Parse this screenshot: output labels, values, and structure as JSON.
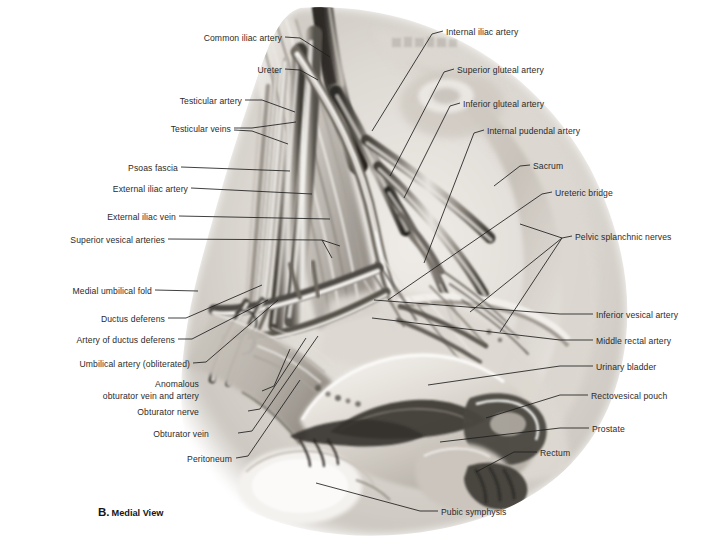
{
  "figure": {
    "caption_letter": "B.",
    "caption_text": "Medial View",
    "style": "grayscale airbrush / pencil medical illustration on white background",
    "palette": {
      "background": "#ffffff",
      "label_text": "#2b2b2b",
      "leader_line": "#1f1f1f",
      "tissue_light": "#e9e6e2",
      "tissue_mid": "#b9b4ae",
      "tissue_dark": "#6d6963",
      "tissue_deep": "#3a3834",
      "highlight": "#fbfaf8"
    }
  },
  "labels_left": [
    {
      "id": "common-iliac-artery",
      "text": "Common iliac artery",
      "x": 282,
      "y": 40
    },
    {
      "id": "ureter",
      "text": "Ureter",
      "x": 282,
      "y": 72
    },
    {
      "id": "testicular-artery",
      "text": "Testicular artery",
      "x": 242,
      "y": 103
    },
    {
      "id": "testicular-veins",
      "text": "Testicular veins",
      "x": 231,
      "y": 131
    },
    {
      "id": "psoas-fascia",
      "text": "Psoas fascia",
      "x": 178,
      "y": 170
    },
    {
      "id": "external-iliac-artery",
      "text": "External iliac artery",
      "x": 188,
      "y": 191
    },
    {
      "id": "external-iliac-vein",
      "text": "External iliac vein",
      "x": 176,
      "y": 219
    },
    {
      "id": "superior-vesical-arteries",
      "text": "Superior vesical arteries",
      "x": 165,
      "y": 242
    },
    {
      "id": "medial-umbilical-fold",
      "text": "Medial umbilical fold",
      "x": 152,
      "y": 293
    },
    {
      "id": "ductus-deferens",
      "text": "Ductus deferens",
      "x": 165,
      "y": 321
    },
    {
      "id": "artery-of-ductus-deferens",
      "text": "Artery of ductus deferens",
      "x": 175,
      "y": 342
    },
    {
      "id": "umbilical-artery-obliterated",
      "text": "Umbilical artery (obliterated)",
      "x": 190,
      "y": 366
    },
    {
      "id": "anomalous-obturator-1",
      "text": "Anomalous",
      "x": 199,
      "y": 386
    },
    {
      "id": "anomalous-obturator-2",
      "text": "obturator vein and artery",
      "x": 199,
      "y": 398
    },
    {
      "id": "obturator-nerve",
      "text": "Obturator nerve",
      "x": 199,
      "y": 414
    },
    {
      "id": "obturator-vein",
      "text": "Obturator vein",
      "x": 209,
      "y": 436
    },
    {
      "id": "peritoneum",
      "text": "Peritoneum",
      "x": 232,
      "y": 461
    }
  ],
  "labels_right": [
    {
      "id": "internal-iliac-artery",
      "text": "Internal iliac artery",
      "x": 446,
      "y": 34
    },
    {
      "id": "superior-gluteal-artery",
      "text": "Superior gluteal artery",
      "x": 457,
      "y": 72
    },
    {
      "id": "inferior-gluteal-artery",
      "text": "Inferior gluteal artery",
      "x": 463,
      "y": 106
    },
    {
      "id": "internal-pudendal-artery",
      "text": "Internal pudendal artery",
      "x": 487,
      "y": 133
    },
    {
      "id": "sacrum",
      "text": "Sacrum",
      "x": 533,
      "y": 168
    },
    {
      "id": "ureteric-bridge",
      "text": "Ureteric bridge",
      "x": 555,
      "y": 195
    },
    {
      "id": "pelvic-splanchnic-nerves",
      "text": "Pelvic splanchnic nerves",
      "x": 575,
      "y": 239
    },
    {
      "id": "inferior-vesical-artery",
      "text": "Inferior vesical artery",
      "x": 596,
      "y": 317
    },
    {
      "id": "middle-rectal-artery",
      "text": "Middle rectal artery",
      "x": 596,
      "y": 343
    },
    {
      "id": "urinary-bladder",
      "text": "Urinary bladder",
      "x": 596,
      "y": 369
    },
    {
      "id": "rectovesical-pouch",
      "text": "Rectovesical pouch",
      "x": 591,
      "y": 398
    },
    {
      "id": "prostate",
      "text": "Prostate",
      "x": 592,
      "y": 431
    },
    {
      "id": "rectum",
      "text": "Rectum",
      "x": 540,
      "y": 455
    },
    {
      "id": "pubic-symphysis",
      "text": "Pubic symphysis",
      "x": 441,
      "y": 514
    }
  ]
}
